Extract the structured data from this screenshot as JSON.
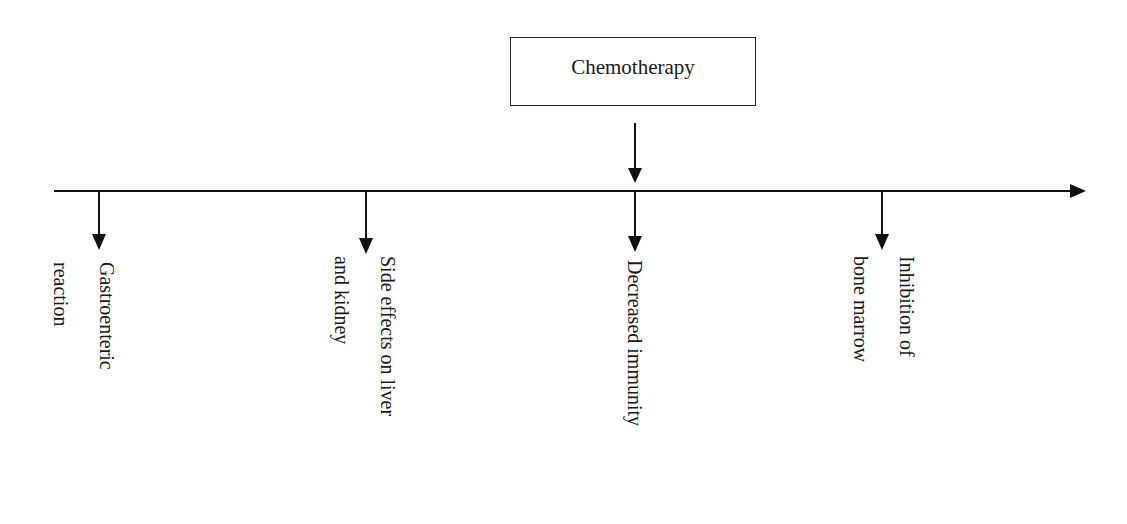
{
  "diagram": {
    "source": {
      "label": "Chemotherapy"
    },
    "effects": [
      {
        "lines": [
          "Gastroenteric",
          "reaction"
        ]
      },
      {
        "lines": [
          "Side effects on liver",
          "and kidney"
        ]
      },
      {
        "lines": [
          "Decreased immunity"
        ]
      },
      {
        "lines": [
          "Inhibition of",
          "bone marrow"
        ]
      }
    ]
  }
}
